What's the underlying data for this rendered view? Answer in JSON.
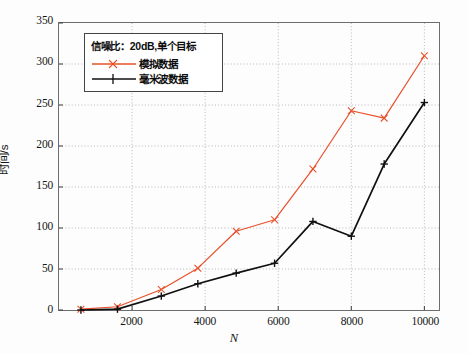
{
  "chart_data": {
    "type": "line",
    "title": "",
    "xlabel": "N",
    "ylabel": "时间/s",
    "xlim": [
      0,
      10400
    ],
    "ylim": [
      0,
      350
    ],
    "xticks": [
      2000,
      4000,
      6000,
      8000,
      10000
    ],
    "yticks": [
      0,
      50,
      100,
      150,
      200,
      250,
      300,
      350
    ],
    "grid": true,
    "grid_style": "dotted",
    "legend_position": "upper-left",
    "legend_title": "信噪比：20dB,单个目标",
    "series": [
      {
        "name": "模拟数据",
        "color": "#E8502A",
        "marker": "plus",
        "x": [
          600,
          1600,
          2800,
          3800,
          4850,
          5900,
          6950,
          8000,
          8900,
          10000
        ],
        "y": [
          1,
          4,
          25,
          51,
          96,
          110,
          172,
          243,
          234,
          310
        ]
      },
      {
        "name": "毫米波数据",
        "color": "#101010",
        "marker": "plus",
        "x": [
          600,
          1600,
          2800,
          3800,
          4850,
          5900,
          6950,
          8000,
          8900,
          10000
        ],
        "y": [
          0,
          1,
          17,
          32,
          45,
          57,
          108,
          90,
          178,
          253
        ]
      }
    ]
  },
  "axes": {
    "y_tick_labels": [
      "350",
      "300",
      "250",
      "200",
      "150",
      "100",
      "50",
      "0"
    ],
    "x_tick_labels": [
      "2000",
      "4000",
      "6000",
      "8000",
      "10000"
    ],
    "x_axis_label": "N",
    "y_axis_label": "时间/s"
  },
  "legend": {
    "title": "信噪比：20dB,单个目标",
    "entries": [
      {
        "label": "模拟数据",
        "color": "#E8502A"
      },
      {
        "label": "毫米波数据",
        "color": "#101010"
      }
    ]
  }
}
